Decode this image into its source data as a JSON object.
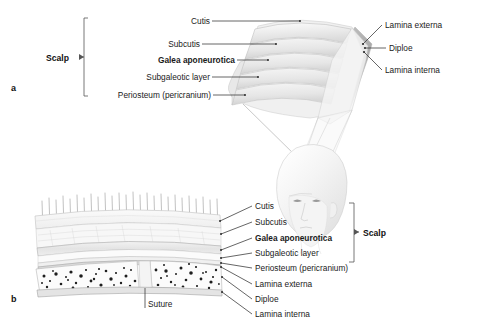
{
  "figure": {
    "background_color": "#ffffff",
    "line_color": "#333333",
    "text_color": "#1a1a1a"
  },
  "panel_a": {
    "marker": "a",
    "scalp_bracket_label": "Scalp",
    "left_labels": [
      {
        "text": "Cutis",
        "bold": false
      },
      {
        "text": "Subcutis",
        "bold": false
      },
      {
        "text": "Galea aponeurotica",
        "bold": true
      },
      {
        "text": "Subgaleotic layer",
        "bold": false
      },
      {
        "text": "Periosteum (pericranium)",
        "bold": false
      }
    ],
    "right_labels": [
      {
        "text": "Lamina externa",
        "bold": false
      },
      {
        "text": "Diploe",
        "bold": false
      },
      {
        "text": "Lamina interna",
        "bold": false
      }
    ]
  },
  "panel_b": {
    "marker": "b",
    "scalp_bracket_label": "Scalp",
    "right_labels": [
      {
        "text": "Cutis",
        "bold": false,
        "in_scalp": true
      },
      {
        "text": "Subcutis",
        "bold": false,
        "in_scalp": true
      },
      {
        "text": "Galea aponeurotica",
        "bold": true,
        "in_scalp": true
      },
      {
        "text": "Subgaleotic layer",
        "bold": false,
        "in_scalp": true
      },
      {
        "text": "Periosteum (pericranium)",
        "bold": false,
        "in_scalp": true
      },
      {
        "text": "Lamina externa",
        "bold": false,
        "in_scalp": false
      },
      {
        "text": "Diploe",
        "bold": false,
        "in_scalp": false
      },
      {
        "text": "Lamina interna",
        "bold": false,
        "in_scalp": false
      }
    ],
    "bottom_label": "Suture"
  }
}
